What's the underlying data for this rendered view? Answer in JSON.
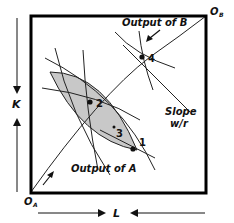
{
  "diagram": {
    "type": "edgeworth-box-production",
    "labels": {
      "origin_a": "O",
      "origin_a_sub": "A",
      "origin_b": "O",
      "origin_b_sub": "B",
      "k_axis": "K",
      "l_axis": "L",
      "output_a": "Output of A",
      "output_b": "Output of B",
      "slope_line1": "Slope",
      "slope_line2": "w/r"
    },
    "points": [
      {
        "id": "1",
        "label": "1"
      },
      {
        "id": "2",
        "label": "2"
      },
      {
        "id": "3",
        "label": "3"
      },
      {
        "id": "4",
        "label": "4"
      }
    ],
    "colors": {
      "frame": "#000000",
      "lens_fill": "#c8c8c8",
      "lines": "#222222"
    }
  }
}
